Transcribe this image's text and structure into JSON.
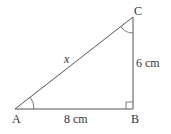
{
  "diagram": {
    "type": "right-triangle",
    "vertices": {
      "A": {
        "label": "A",
        "x": 15,
        "y": 109
      },
      "B": {
        "label": "B",
        "x": 133,
        "y": 109
      },
      "C": {
        "label": "C",
        "x": 133,
        "y": 17
      }
    },
    "sides": {
      "AB": "8 cm",
      "BC": "6 cm",
      "AC": "x"
    },
    "right_angle_at": "B",
    "marked_angles": [
      "A",
      "C"
    ],
    "line_color": "#555555"
  }
}
